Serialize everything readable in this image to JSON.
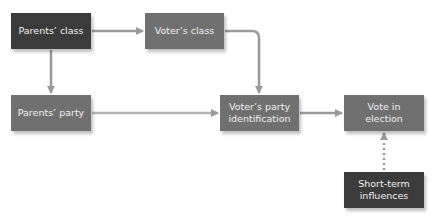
{
  "diagram": {
    "nodes": [
      {
        "id": "parents_class",
        "label": "Parents’ class",
        "style": "dark"
      },
      {
        "id": "voters_class",
        "label": "Voter’s class",
        "style": "mid"
      },
      {
        "id": "parents_party",
        "label": "Parents’ party",
        "style": "mid"
      },
      {
        "id": "voters_party_id",
        "label": "Voter’s party identification",
        "style": "mid"
      },
      {
        "id": "vote_in_election",
        "label": "Vote in election",
        "style": "mid"
      },
      {
        "id": "short_term",
        "label": "Short-term influences",
        "style": "dark"
      }
    ],
    "edges": [
      {
        "from": "parents_class",
        "to": "voters_class",
        "style": "solid"
      },
      {
        "from": "parents_class",
        "to": "parents_party",
        "style": "solid"
      },
      {
        "from": "voters_class",
        "to": "voters_party_id",
        "style": "solid"
      },
      {
        "from": "parents_party",
        "to": "voters_party_id",
        "style": "solid"
      },
      {
        "from": "voters_party_id",
        "to": "vote_in_election",
        "style": "solid"
      },
      {
        "from": "short_term",
        "to": "vote_in_election",
        "style": "dotted"
      }
    ],
    "colors": {
      "dark": "#3b3b3b",
      "mid": "#707070",
      "arrow": "#9a9a9a",
      "text": "#f0f0f0"
    }
  }
}
